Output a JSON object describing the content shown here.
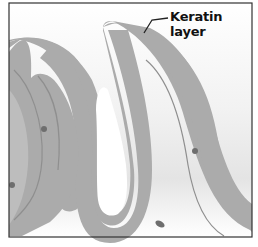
{
  "diagram": {
    "labels": [
      {
        "text": "Keratin layer",
        "target": "keratin-layer-fold"
      }
    ],
    "colors": {
      "keratin": "#a9a9a9",
      "inner_line": "#8f8f8f",
      "background_gradient_top": "#ffffff",
      "background_gradient_bottom": "#e6e6e6",
      "dots": "#6e6e6e",
      "border": "#333333"
    }
  }
}
